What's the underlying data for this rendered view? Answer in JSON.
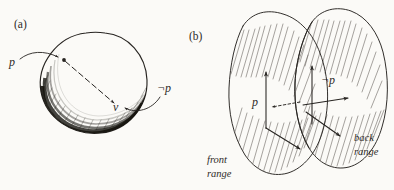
{
  "figure": {
    "caption_a": "(a)",
    "caption_b": "(b)",
    "panel_a": {
      "name": "sphere-diagram",
      "labels": {
        "p": "p",
        "not_p": "¬p",
        "v": "v"
      },
      "description_items": [
        "sphere-outline",
        "shaded-crescent",
        "dashed-vector-arrow",
        "curved-pointer-to-p",
        "curved-pointer-to-not-p"
      ]
    },
    "panel_b": {
      "name": "two-ranges-diagram",
      "labels": {
        "p": "p",
        "not_p": "¬p",
        "front_range_line1": "front",
        "front_range_line2": "range",
        "back_range_line1": "back",
        "back_range_line2": "range"
      },
      "description_items": [
        "front-range-ellipse",
        "back-range-ellipse",
        "front-vector-frame",
        "back-vector-frame",
        "dotted-p-arrow"
      ]
    },
    "colors": {
      "paper": "#fbfaf7",
      "ink": "#272421",
      "hatch": "#6b6762",
      "shade": "#17150f"
    }
  }
}
